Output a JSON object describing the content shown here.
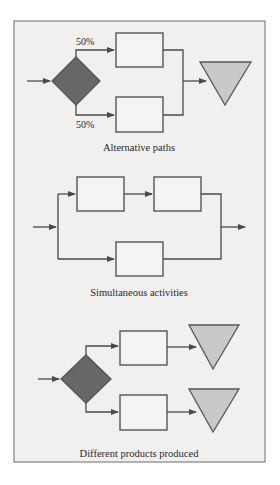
{
  "colors": {
    "panel_bg": "#f0f0ef",
    "panel_border": "#6d6d6d",
    "decision_fill": "#676767",
    "storage_fill": "#c9c9c9",
    "box_fill": "#f4f4f3",
    "line": "#4a4a4a"
  },
  "sections": [
    {
      "id": "alternative-paths",
      "caption": "Alternative paths",
      "labels": {
        "top_percent": "50%",
        "bottom_percent": "50%"
      }
    },
    {
      "id": "simultaneous-activities",
      "caption": "Simultaneous activities"
    },
    {
      "id": "different-products",
      "caption": "Different products produced"
    }
  ]
}
